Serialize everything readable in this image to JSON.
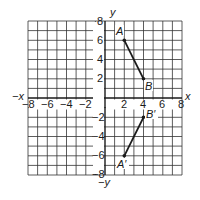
{
  "diagram": {
    "type": "coordinate-plane",
    "x_range": [
      -8,
      8
    ],
    "y_range": [
      -8,
      8
    ],
    "grid_step": 1,
    "axis_labels": {
      "x_pos": "x",
      "x_neg": "−x",
      "y_pos": "y",
      "y_neg": "−y"
    },
    "x_tick_labels": [
      "−8",
      "−6",
      "−4",
      "−2",
      "2",
      "4",
      "6",
      "8"
    ],
    "y_tick_labels": [
      "8",
      "6",
      "4",
      "2",
      "−2",
      "−4",
      "−6",
      "−8"
    ],
    "points": [
      {
        "label": "A",
        "x": 2,
        "y": 6
      },
      {
        "label": "B",
        "x": 4,
        "y": 2
      },
      {
        "label": "B′",
        "x": 4,
        "y": -2
      },
      {
        "label": "A′",
        "x": 2,
        "y": -6
      }
    ],
    "segments": [
      {
        "from": "A",
        "to": "B"
      },
      {
        "from": "B′",
        "to": "A′"
      }
    ],
    "colors": {
      "grid": "#333333",
      "ink": "#1a1a1a",
      "background": "#ffffff"
    }
  }
}
